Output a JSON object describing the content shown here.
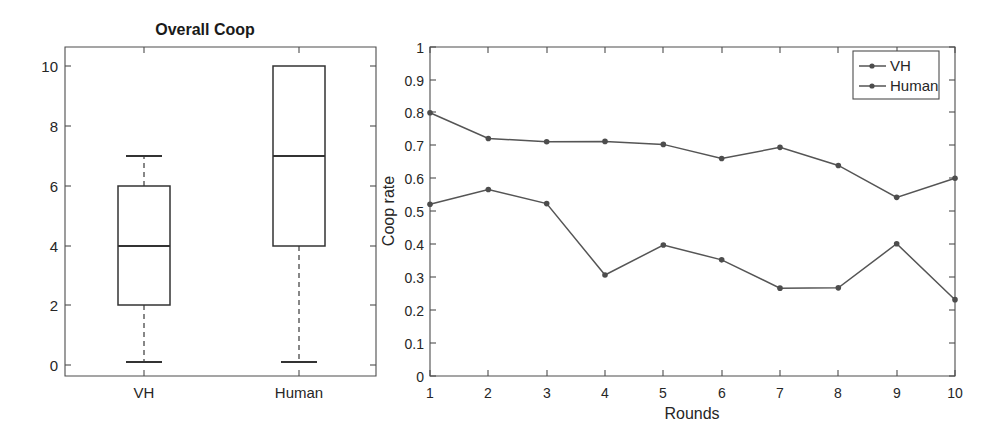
{
  "figure": {
    "width": 995,
    "height": 424,
    "background": "#ffffff",
    "ink_color": "#333333",
    "axis_color": "#4d4d4d"
  },
  "chart_data": [
    {
      "type": "box",
      "title": "Overall Coop",
      "xlabel": "",
      "ylabel": "",
      "ylim": [
        -0.35,
        10.6
      ],
      "yticks": [
        "0",
        "2",
        "4",
        "6",
        "8",
        "10"
      ],
      "ytick_values": [
        0,
        2,
        4,
        6,
        8,
        10
      ],
      "categories": [
        "VH",
        "Human"
      ],
      "grid": false,
      "legend": "none",
      "boxes": [
        {
          "name": "VH",
          "whisker_low": 0.1,
          "q1": 2,
          "median": 4,
          "q3": 6,
          "whisker_high": 7
        },
        {
          "name": "Human",
          "whisker_low": 0.1,
          "q1": 4,
          "median": 7,
          "q3": 10,
          "whisker_high": 10
        }
      ]
    },
    {
      "type": "line",
      "title": "",
      "xlabel": "Rounds",
      "ylabel": "Coop rate",
      "xlim": [
        1,
        10
      ],
      "ylim": [
        0,
        1
      ],
      "xticks": [
        "1",
        "2",
        "3",
        "4",
        "5",
        "6",
        "7",
        "8",
        "9",
        "10"
      ],
      "yticks": [
        "0",
        "0.1",
        "0.2",
        "0.3",
        "0.4",
        "0.5",
        "0.6",
        "0.7",
        "0.8",
        "0.9",
        "1"
      ],
      "ytick_values": [
        0,
        0.1,
        0.2,
        0.3,
        0.4,
        0.5,
        0.6,
        0.7,
        0.8,
        0.9,
        1
      ],
      "x": [
        1,
        2,
        3,
        4,
        5,
        6,
        7,
        8,
        9,
        10
      ],
      "grid": false,
      "legend_position": "top-right",
      "series": [
        {
          "name": "VH",
          "marker": "dot",
          "values": [
            0.522,
            0.567,
            0.524,
            0.307,
            0.398,
            0.353,
            0.267,
            0.268,
            0.402,
            0.232
          ]
        },
        {
          "name": "Human",
          "marker": "dot",
          "values": [
            0.8,
            0.722,
            0.712,
            0.713,
            0.704,
            0.661,
            0.695,
            0.64,
            0.543,
            0.601
          ]
        }
      ]
    }
  ],
  "left_panel": {
    "title": "Overall Coop",
    "ytick_labels": [
      "10",
      "8",
      "6",
      "4",
      "2",
      "0"
    ],
    "category_labels": [
      "VH",
      "Human"
    ]
  },
  "right_panel": {
    "ylabel": "Coop rate",
    "xlabel": "Rounds",
    "ytick_labels": [
      "1",
      "0.9",
      "0.8",
      "0.7",
      "0.6",
      "0.5",
      "0.4",
      "0.3",
      "0.2",
      "0.1",
      "0"
    ],
    "xtick_labels": [
      "1",
      "2",
      "3",
      "4",
      "5",
      "6",
      "7",
      "8",
      "9",
      "10"
    ],
    "legend": {
      "items": [
        {
          "label": "VH"
        },
        {
          "label": "Human"
        }
      ]
    }
  }
}
